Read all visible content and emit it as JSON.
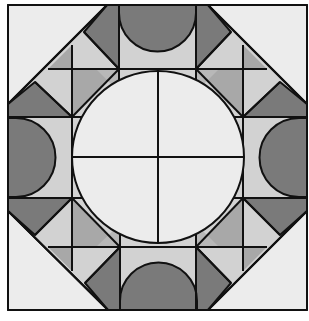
{
  "diagram": {
    "colors": {
      "background": "#ffffff",
      "outline": "#111111",
      "very_light": "#ececec",
      "light": "#d2d2d2",
      "medium": "#a8a8a8",
      "dark": "#7a7a7a"
    },
    "elements": {
      "outer_square": "outer-square",
      "corner_triangles": 4,
      "edge_semicircles": 4,
      "center_circle_quadrants": 4
    }
  }
}
